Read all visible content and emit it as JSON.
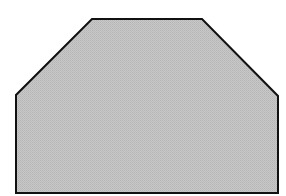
{
  "diagram": {
    "shape": "pentagon-trapezoid",
    "vertices": [
      [
        92,
        19
      ],
      [
        202,
        19
      ],
      [
        278,
        96
      ],
      [
        278,
        193
      ],
      [
        16,
        193
      ],
      [
        16,
        95
      ]
    ],
    "fill_color": "#c4c4c4",
    "fill_texture": "dithered-gray",
    "stroke_color": "#111111",
    "stroke_width": 2
  }
}
